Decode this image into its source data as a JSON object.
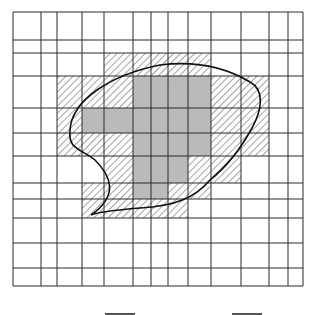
{
  "diagram": {
    "type": "raster-approximation-grid",
    "grid": {
      "x_lines": [
        13,
        41,
        57,
        82,
        104,
        133,
        151,
        168,
        188,
        211,
        241,
        269,
        288,
        303
      ],
      "y_lines": [
        12,
        40,
        53,
        76,
        108,
        133,
        156,
        183,
        199,
        218,
        243,
        268,
        286
      ]
    },
    "colors": {
      "grid_line": "#2a2a2a",
      "interior_fill": "#bdbdbd",
      "hatch_line": "#555555",
      "outline": "#111111",
      "background": "#ffffff"
    },
    "cell_legend": {
      "grey": "cell fully inside region",
      "hatch": "cell partially inside region (boundary)",
      "white": "cell outside region"
    },
    "cells": {
      "hatched": [
        [
          2,
          4
        ],
        [
          2,
          5
        ],
        [
          2,
          6
        ],
        [
          2,
          7
        ],
        [
          2,
          8
        ],
        [
          3,
          2
        ],
        [
          3,
          3
        ],
        [
          3,
          4
        ],
        [
          3,
          9
        ],
        [
          3,
          10
        ],
        [
          4,
          2
        ],
        [
          4,
          9
        ],
        [
          4,
          10
        ],
        [
          5,
          2
        ],
        [
          5,
          3
        ],
        [
          5,
          4
        ],
        [
          5,
          9
        ],
        [
          5,
          10
        ],
        [
          6,
          4
        ],
        [
          6,
          8
        ],
        [
          6,
          9
        ],
        [
          7,
          3
        ],
        [
          7,
          4
        ],
        [
          7,
          7
        ],
        [
          7,
          8
        ],
        [
          8,
          3
        ],
        [
          8,
          4
        ],
        [
          8,
          5
        ],
        [
          8,
          6
        ],
        [
          8,
          7
        ]
      ],
      "grey": [
        [
          3,
          5
        ],
        [
          3,
          6
        ],
        [
          3,
          7
        ],
        [
          3,
          8
        ],
        [
          4,
          3
        ],
        [
          4,
          4
        ],
        [
          4,
          5
        ],
        [
          4,
          6
        ],
        [
          4,
          7
        ],
        [
          4,
          8
        ],
        [
          5,
          5
        ],
        [
          5,
          6
        ],
        [
          5,
          7
        ],
        [
          5,
          8
        ],
        [
          6,
          5
        ],
        [
          6,
          6
        ],
        [
          6,
          7
        ],
        [
          7,
          5
        ],
        [
          7,
          6
        ]
      ]
    },
    "outline_path": "M 91 215 C 120 195, 110 175, 95 160 C 80 148, 68 150, 70 130 C 72 100, 110 75, 160 65 C 200 60, 230 70, 250 82 C 265 90, 262 110, 252 128 C 240 150, 225 168, 210 180 C 195 198, 175 206, 140 208 C 115 210, 98 212, 91 215 Z",
    "legend_swatches": [
      {
        "x": 105,
        "y": 313,
        "width": 30
      },
      {
        "x": 232,
        "y": 313,
        "width": 30
      }
    ]
  }
}
